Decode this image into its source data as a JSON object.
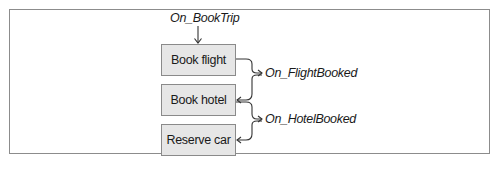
{
  "diagram": {
    "trigger_event": "On_BookTrip",
    "steps": [
      {
        "label": "Book flight"
      },
      {
        "label": "Book hotel"
      },
      {
        "label": "Reserve car"
      }
    ],
    "events": [
      {
        "label": "On_FlightBooked",
        "from": "Book flight",
        "to": "Book hotel"
      },
      {
        "label": "On_HotelBooked",
        "from": "Book hotel",
        "to": "Reserve car"
      }
    ],
    "colors": {
      "box_fill": "#e6e6e6",
      "box_border": "#8a8a8a",
      "frame_border": "#8c8c8c",
      "line": "#333333"
    }
  }
}
